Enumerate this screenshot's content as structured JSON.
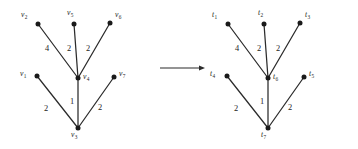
{
  "figure": {
    "background_color": "#ffffff",
    "ink_color": "#2b2b2b",
    "width": 358,
    "height": 149,
    "arrow": {
      "name": "transformation-arrow",
      "direction": "right",
      "x1": 160,
      "x2": 205,
      "y": 68
    }
  },
  "graphs": [
    {
      "id": "left-graph",
      "name": "left-weighted-tree",
      "label_prefix": "v",
      "vertices": [
        {
          "id": "v1",
          "base": "v",
          "sub": "1",
          "x": 37,
          "y": 76,
          "label_x": 20,
          "label_y": 70,
          "label_align": "left"
        },
        {
          "id": "v2",
          "base": "v",
          "sub": "2",
          "x": 38,
          "y": 24,
          "label_x": 21,
          "label_y": 11,
          "label_align": "left"
        },
        {
          "id": "v3",
          "base": "v",
          "sub": "3",
          "x": 78,
          "y": 128,
          "label_x": 71,
          "label_y": 131,
          "label_align": "left"
        },
        {
          "id": "v4",
          "base": "v",
          "sub": "4",
          "x": 78,
          "y": 78,
          "label_x": 83,
          "label_y": 73,
          "label_align": "left"
        },
        {
          "id": "v5",
          "base": "v",
          "sub": "5",
          "x": 74,
          "y": 24,
          "label_x": 67,
          "label_y": 9,
          "label_align": "left"
        },
        {
          "id": "v6",
          "base": "v",
          "sub": "6",
          "x": 110,
          "y": 23,
          "label_x": 115,
          "label_y": 11,
          "label_align": "left"
        },
        {
          "id": "v7",
          "base": "v",
          "sub": "7",
          "x": 114,
          "y": 77,
          "label_x": 119,
          "label_y": 70,
          "label_align": "left"
        }
      ],
      "edges": [
        {
          "from": "v2",
          "to": "v4",
          "weight": "4",
          "label_x": 45,
          "label_y": 45
        },
        {
          "from": "v5",
          "to": "v4",
          "weight": "2",
          "label_x": 67,
          "label_y": 45
        },
        {
          "from": "v6",
          "to": "v4",
          "weight": "2",
          "label_x": 86,
          "label_y": 45
        },
        {
          "from": "v1",
          "to": "v3",
          "weight": "2",
          "label_x": 44,
          "label_y": 105
        },
        {
          "from": "v4",
          "to": "v3",
          "weight": "1",
          "label_x": 70,
          "label_y": 98
        },
        {
          "from": "v7",
          "to": "v3",
          "weight": "2",
          "label_x": 98,
          "label_y": 104
        }
      ]
    },
    {
      "id": "right-graph",
      "name": "right-weighted-tree",
      "label_prefix": "t",
      "vertices": [
        {
          "id": "t1",
          "base": "t",
          "sub": "1",
          "x": 228,
          "y": 24,
          "label_x": 212,
          "label_y": 11,
          "label_align": "left"
        },
        {
          "id": "t2",
          "base": "t",
          "sub": "2",
          "x": 264,
          "y": 24,
          "label_x": 258,
          "label_y": 9,
          "label_align": "left"
        },
        {
          "id": "t3",
          "base": "t",
          "sub": "3",
          "x": 300,
          "y": 23,
          "label_x": 305,
          "label_y": 11,
          "label_align": "left"
        },
        {
          "id": "t4",
          "base": "t",
          "sub": "4",
          "x": 227,
          "y": 76,
          "label_x": 210,
          "label_y": 70,
          "label_align": "left"
        },
        {
          "id": "t5",
          "base": "t",
          "sub": "5",
          "x": 304,
          "y": 77,
          "label_x": 309,
          "label_y": 70,
          "label_align": "left"
        },
        {
          "id": "t6",
          "base": "t",
          "sub": "6",
          "x": 268,
          "y": 78,
          "label_x": 273,
          "label_y": 73,
          "label_align": "left"
        },
        {
          "id": "t7",
          "base": "t",
          "sub": "7",
          "x": 268,
          "y": 128,
          "label_x": 261,
          "label_y": 131,
          "label_align": "left"
        }
      ],
      "edges": [
        {
          "from": "t1",
          "to": "t6",
          "weight": "4",
          "label_x": 235,
          "label_y": 45
        },
        {
          "from": "t2",
          "to": "t6",
          "weight": "2",
          "label_x": 257,
          "label_y": 45
        },
        {
          "from": "t3",
          "to": "t6",
          "weight": "2",
          "label_x": 276,
          "label_y": 45
        },
        {
          "from": "t4",
          "to": "t7",
          "weight": "2",
          "label_x": 234,
          "label_y": 105
        },
        {
          "from": "t6",
          "to": "t7",
          "weight": "1",
          "label_x": 260,
          "label_y": 98
        },
        {
          "from": "t5",
          "to": "t7",
          "weight": "2",
          "label_x": 288,
          "label_y": 104
        }
      ]
    }
  ]
}
